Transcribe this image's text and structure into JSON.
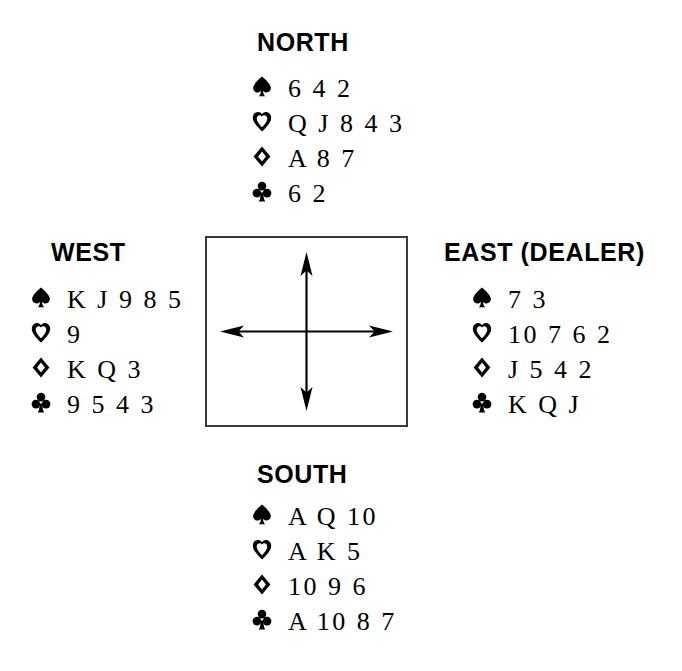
{
  "diagram": {
    "kind": "bridge-hand-deal",
    "suit_glyphs": {
      "spade": "spade-icon",
      "heart": "heart-icon",
      "diamond": "diamond-icon",
      "club": "club-icon"
    },
    "center": {
      "name": "compass-arrows",
      "directions": [
        "north",
        "south",
        "east",
        "west"
      ]
    },
    "seats": {
      "north": {
        "label": "NORTH",
        "suits": [
          {
            "suit": "spade",
            "cards": "6 4 2"
          },
          {
            "suit": "heart",
            "cards": "Q J 8 4 3"
          },
          {
            "suit": "diamond",
            "cards": "A 8 7"
          },
          {
            "suit": "club",
            "cards": "6 2"
          }
        ]
      },
      "west": {
        "label": "WEST",
        "suits": [
          {
            "suit": "spade",
            "cards": "K J 9 8 5"
          },
          {
            "suit": "heart",
            "cards": "9"
          },
          {
            "suit": "diamond",
            "cards": "K Q 3"
          },
          {
            "suit": "club",
            "cards": "9 5 4 3"
          }
        ]
      },
      "east": {
        "label": "EAST (DEALER)",
        "suits": [
          {
            "suit": "spade",
            "cards": "7 3"
          },
          {
            "suit": "heart",
            "cards": "10 7 6 2"
          },
          {
            "suit": "diamond",
            "cards": "J 5 4 2"
          },
          {
            "suit": "club",
            "cards": "K Q J"
          }
        ]
      },
      "south": {
        "label": "SOUTH",
        "suits": [
          {
            "suit": "spade",
            "cards": "A Q 10"
          },
          {
            "suit": "heart",
            "cards": "A K 5"
          },
          {
            "suit": "diamond",
            "cards": "10 9 6"
          },
          {
            "suit": "club",
            "cards": "A 10 8 7"
          }
        ]
      }
    }
  }
}
